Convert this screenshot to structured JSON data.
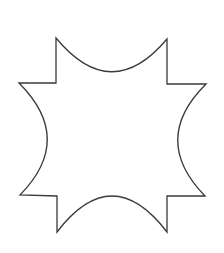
{
  "canvas": {
    "width": 224,
    "height": 253,
    "background_color": "#ffffff"
  },
  "figure": {
    "name": "six-pointed-concave-star",
    "stroke_color": "#3a3a3a",
    "fill_color": "#ffffff",
    "stroke_width": 1.3,
    "points": [
      {
        "label": "top-left-spike-tip",
        "x": 56,
        "y": 38
      },
      {
        "label": "top-right-spike-tip",
        "x": 167,
        "y": 39
      },
      {
        "label": "right-upper-tip",
        "x": 206,
        "y": 84
      },
      {
        "label": "right-lower-tip",
        "x": 205,
        "y": 196
      },
      {
        "label": "bottom-right-spike-tip",
        "x": 167,
        "y": 232
      },
      {
        "label": "bottom-left-spike-tip",
        "x": 57,
        "y": 232
      },
      {
        "label": "left-lower-tip",
        "x": 20,
        "y": 195
      },
      {
        "label": "left-upper-tip",
        "x": 19,
        "y": 83
      }
    ],
    "arcs": [
      {
        "label": "top-concave-arc",
        "from": "top-left-spike-tip",
        "to": "top-right-spike-tip",
        "sagitta_y": 73,
        "direction": "inward"
      },
      {
        "label": "right-concave-arc",
        "from": "right-upper-tip",
        "to": "right-lower-tip",
        "sagitta_x": 178,
        "direction": "inward"
      },
      {
        "label": "bottom-concave-arc",
        "from": "bottom-right-spike-tip",
        "to": "bottom-left-spike-tip",
        "sagitta_y": 197,
        "direction": "inward"
      },
      {
        "label": "left-concave-arc",
        "from": "left-lower-tip",
        "to": "left-upper-tip",
        "sagitta_x": 46,
        "direction": "inward"
      }
    ],
    "path": "M 56 38 Q 111.5 105 167 39 L 167 84 L 206 84 Q 150 139.5 205 196 L 167 196 L 167 232 Q 112 160 57 232 L 57 196 L 20 195 Q 75 139 19 83 L 56 83 Z"
  }
}
